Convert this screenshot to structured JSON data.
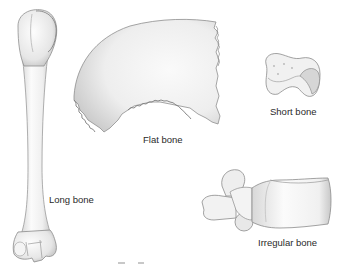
{
  "figure": {
    "background": "#ffffff",
    "bones": [
      {
        "id": "long",
        "label": "Long bone",
        "example": "humerus"
      },
      {
        "id": "flat",
        "label": "Flat bone",
        "example": "parietal bone of skull"
      },
      {
        "id": "short",
        "label": "Short bone",
        "example": "carpal bone"
      },
      {
        "id": "irregular",
        "label": "Irregular bone",
        "example": "vertebra"
      }
    ],
    "colors": {
      "bone_fill": "#f2f2f2",
      "bone_shade": "#c9c9c9",
      "bone_outline": "#8a8a8a",
      "label_text": "#2a2a2a"
    }
  }
}
